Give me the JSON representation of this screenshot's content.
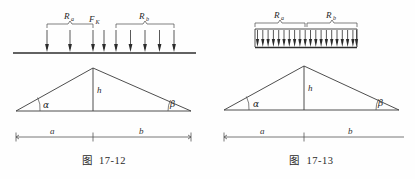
{
  "sheet": {
    "width": 415,
    "height": 179,
    "background": "#fefefe",
    "ink": "#2e2e2e"
  },
  "figures": [
    {
      "id": "fig-17-12",
      "caption_label": "图",
      "caption_number": "17-12",
      "load_type": "concentrated point loads",
      "labels": {
        "reaction_a": "R",
        "reaction_a_sub": "a",
        "reaction_b": "R",
        "reaction_b_sub": "b",
        "point_force": "F",
        "point_force_sub": "K",
        "height": "h",
        "angle_left": "α",
        "angle_right": "β",
        "span_left": "a",
        "span_right": "b"
      },
      "arrow_counts": {
        "group_a": 3,
        "point_force": 1,
        "group_b": 5,
        "total": 9
      }
    },
    {
      "id": "fig-17-13",
      "caption_label": "图",
      "caption_number": "17-13",
      "load_type": "uniformly distributed load",
      "labels": {
        "reaction_a": "R",
        "reaction_a_sub": "a",
        "reaction_b": "R",
        "reaction_b_sub": "b",
        "height": "h",
        "angle_left": "α",
        "angle_right": "β",
        "span_left": "a",
        "span_right": "b"
      },
      "arrow_counts": {
        "group_a": 10,
        "group_b": 10,
        "total": 20
      }
    }
  ]
}
